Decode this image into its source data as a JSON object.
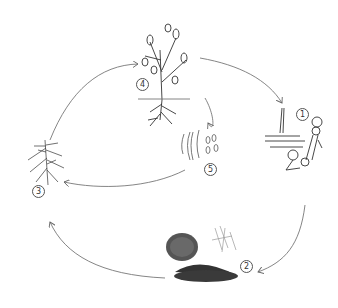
{
  "diagram": {
    "type": "cycle",
    "stages": [
      {
        "id": 1,
        "label": "1",
        "depiction": "fungal hyphae and spores on tissue"
      },
      {
        "id": 2,
        "label": "2",
        "depiction": "soil, plant debris and organic matter"
      },
      {
        "id": 3,
        "label": "3",
        "depiction": "root system"
      },
      {
        "id": 4,
        "label": "4",
        "depiction": "infected plant with roots"
      },
      {
        "id": 5,
        "label": "5",
        "depiction": "spores / conidia"
      }
    ],
    "arrows": [
      {
        "from": 4,
        "to": 1
      },
      {
        "from": 1,
        "to": 2
      },
      {
        "from": 2,
        "to": 3
      },
      {
        "from": 3,
        "to": 4
      },
      {
        "from": 4,
        "to": 5
      },
      {
        "from": 5,
        "to": 3
      }
    ],
    "colors": {
      "line": "#666666",
      "ink": "#333333",
      "background": "#ffffff"
    }
  }
}
